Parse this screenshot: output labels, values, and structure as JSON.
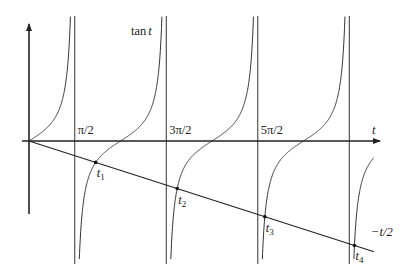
{
  "diagram": {
    "type": "function_plot",
    "colors": {
      "curve": "#333333",
      "axis": "#222222",
      "background": "#ffffff"
    },
    "axes": {
      "x_label": "t",
      "origin_px": [
        29,
        141
      ],
      "x_end_px": 380,
      "y_top_px": 24,
      "y_bottom_px": 214
    },
    "scale": {
      "px_per_unit_x": 29.13,
      "px_per_unit_y": 18.7
    },
    "asymptotes": [
      {
        "label": "π/2",
        "label_prefix": "",
        "t_over_pi": 0.5
      },
      {
        "label": "3π/2",
        "t_over_pi": 1.5
      },
      {
        "label": "5π/2",
        "t_over_pi": 2.5
      },
      {
        "label": "",
        "t_over_pi": 3.5
      }
    ],
    "curve_label": {
      "text_main": "tan",
      "text_var": "t"
    },
    "line_label": {
      "text": "−t/2"
    },
    "intersections": [
      {
        "name": "t",
        "sub": "1"
      },
      {
        "name": "t",
        "sub": "2"
      },
      {
        "name": "t",
        "sub": "3"
      },
      {
        "name": "t",
        "sub": "4"
      }
    ]
  }
}
